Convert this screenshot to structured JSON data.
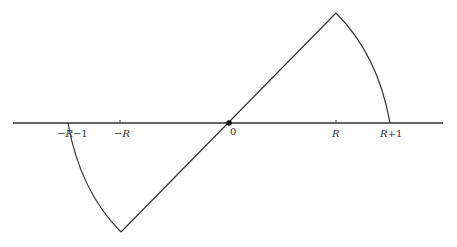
{
  "diagram": {
    "type": "piecewise-function-graph",
    "colors": {
      "stroke": "#333333",
      "background": "#ffffff"
    },
    "axis": {
      "labels": [
        {
          "id": "neg_r_plus_1",
          "text_parts": [
            "−",
            "R",
            "−1"
          ],
          "display": "−R−1"
        },
        {
          "id": "neg_r",
          "text_parts": [
            "−",
            "R"
          ],
          "display": "−R"
        },
        {
          "id": "zero",
          "display": "0"
        },
        {
          "id": "r",
          "display": "R"
        },
        {
          "id": "r_plus_1",
          "text_parts": [
            "R",
            "+1"
          ],
          "display": "R+1"
        }
      ]
    },
    "label_text": {
      "minus": "−",
      "R": "R",
      "minus_one": "−1",
      "plus_one": "+1",
      "zero": "0"
    }
  }
}
